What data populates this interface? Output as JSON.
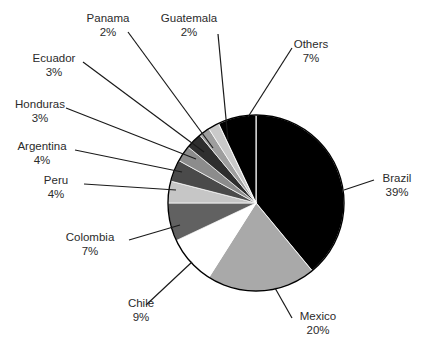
{
  "chart_data": {
    "type": "pie",
    "title": "",
    "subtitle": "",
    "xlabel": "",
    "ylabel": "",
    "legend_position": "none",
    "labels_position": "outside-callout",
    "grid": false,
    "unit": "%",
    "categories": [
      "Brazil",
      "Mexico",
      "Chile",
      "Colombia",
      "Peru",
      "Argentina",
      "Honduras",
      "Ecuador",
      "Panama",
      "Guatemala",
      "Others"
    ],
    "values": [
      39,
      20,
      9,
      7,
      4,
      4,
      3,
      3,
      2,
      2,
      7
    ],
    "slices": [
      {
        "label": "Brazil",
        "value": 39,
        "value_text": "39%",
        "color": "#000000"
      },
      {
        "label": "Mexico",
        "value": 20,
        "value_text": "20%",
        "color": "#a9a9a9"
      },
      {
        "label": "Chile",
        "value": 9,
        "value_text": "9%",
        "color": "#ffffff"
      },
      {
        "label": "Colombia",
        "value": 7,
        "value_text": "7%",
        "color": "#616161"
      },
      {
        "label": "Peru",
        "value": 4,
        "value_text": "4%",
        "color": "#c6c6c6"
      },
      {
        "label": "Argentina",
        "value": 4,
        "value_text": "4%",
        "color": "#4a4a4a"
      },
      {
        "label": "Honduras",
        "value": 3,
        "value_text": "3%",
        "color": "#8c8c8c"
      },
      {
        "label": "Ecuador",
        "value": 3,
        "value_text": "3%",
        "color": "#2e2e2e"
      },
      {
        "label": "Panama",
        "value": 2,
        "value_text": "2%",
        "color": "#9e9e9e"
      },
      {
        "label": "Guatemala",
        "value": 2,
        "value_text": "2%",
        "color": "#c9c9c9"
      },
      {
        "label": "Others",
        "value": 7,
        "value_text": "7%",
        "color": "#000000"
      }
    ],
    "total": 100
  },
  "labels": {
    "panama": {
      "name": "Panama",
      "value": "2%"
    },
    "guatemala": {
      "name": "Guatemala",
      "value": "2%"
    },
    "others": {
      "name": "Others",
      "value": "7%"
    },
    "ecuador": {
      "name": "Ecuador",
      "value": "3%"
    },
    "honduras": {
      "name": "Honduras",
      "value": "3%"
    },
    "argentina": {
      "name": "Argentina",
      "value": "4%"
    },
    "peru": {
      "name": "Peru",
      "value": "4%"
    },
    "colombia": {
      "name": "Colombia",
      "value": "7%"
    },
    "chile": {
      "name": "Chile",
      "value": "9%"
    },
    "mexico": {
      "name": "Mexico",
      "value": "20%"
    },
    "brazil": {
      "name": "Brazil",
      "value": "39%"
    }
  },
  "style": {
    "outline_color": "#000000",
    "text_color": "#2b2b2b",
    "background": "#ffffff"
  }
}
